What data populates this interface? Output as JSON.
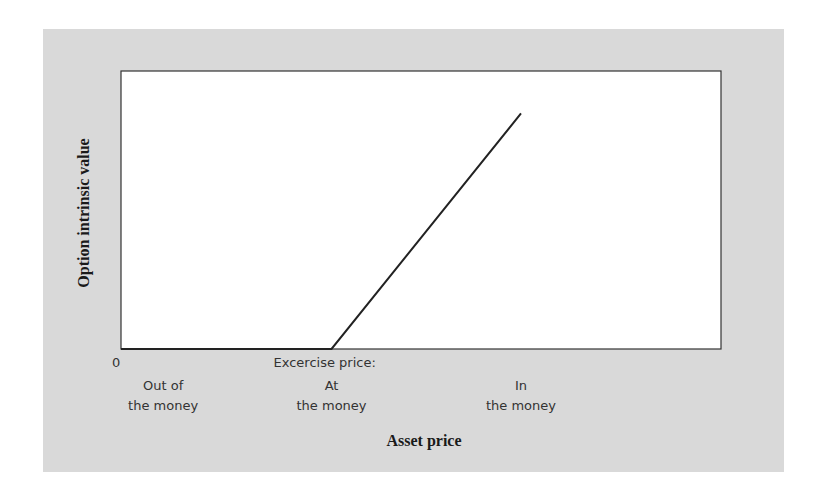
{
  "chart_data": {
    "type": "line",
    "title": "",
    "xlabel": "Asset price",
    "ylabel": "Option intrinsic value",
    "x_origin_label": "0",
    "x_annotations": [
      {
        "lines": [
          "Out of",
          "the money"
        ],
        "x": 0.2
      },
      {
        "lines": [
          "Excercise price:",
          "At",
          "the money"
        ],
        "x": 1.0
      },
      {
        "lines": [
          "In",
          "the money"
        ],
        "x": 1.9
      }
    ],
    "series": [
      {
        "name": "Call option intrinsic value",
        "points": [
          [
            0,
            0
          ],
          [
            1.0,
            0
          ],
          [
            1.9,
            1.0
          ]
        ]
      }
    ],
    "xlim": [
      0,
      2.85
    ],
    "ylim": [
      0,
      1.18
    ],
    "grid": false,
    "legend": "none",
    "colors": {
      "panel": "#d9d9d9",
      "plot": "#ffffff",
      "line": "#222222"
    }
  }
}
